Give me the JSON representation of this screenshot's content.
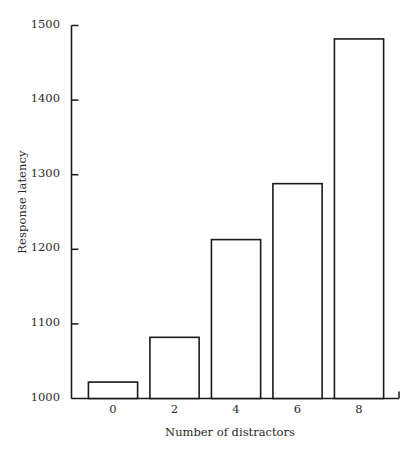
{
  "chart_data": {
    "type": "bar",
    "title": "",
    "subtitle": "",
    "xlabel": "Number of distractors",
    "ylabel": "Response latency",
    "categories": [
      "0",
      "2",
      "4",
      "6",
      "8"
    ],
    "x": [
      0,
      2,
      4,
      6,
      8
    ],
    "values": [
      1022,
      1082,
      1213,
      1288,
      1482
    ],
    "xlim": [
      -1.35,
      9.3
    ],
    "ylim": [
      1000,
      1500
    ],
    "yticks": [
      1000,
      1100,
      1200,
      1300,
      1400,
      1500
    ],
    "ytick_labels": [
      "1000",
      "1100",
      "1200",
      "1300",
      "1400",
      "1500"
    ],
    "xticks": [
      0,
      2,
      4,
      6,
      8
    ],
    "xtick_labels": [
      "0",
      "2",
      "4",
      "6",
      "8"
    ],
    "grid": false,
    "legend": null,
    "bar_width": 1.6,
    "bar_fill": "#ffffff",
    "bar_edge_color": "#1a1a1a",
    "axis_color": "#1a1a1a",
    "text_color": "#2b2b2b"
  },
  "axes": {
    "y_title": "Response latency",
    "x_title": "Number of distractors"
  }
}
